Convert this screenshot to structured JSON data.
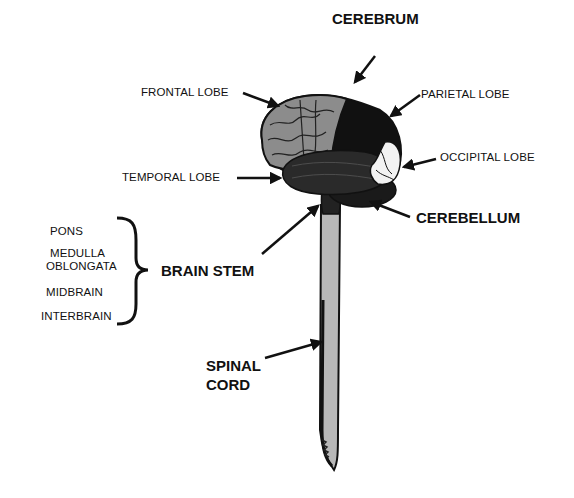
{
  "diagram": {
    "labels": {
      "cerebrum": "CEREBRUM",
      "frontal_lobe": "FRONTAL LOBE",
      "parietal_lobe": "PARIETAL LOBE",
      "occipital_lobe": "OCCIPITAL LOBE",
      "temporal_lobe": "TEMPORAL LOBE",
      "cerebellum": "CEREBELLUM",
      "brain_stem": "BRAIN STEM",
      "spinal_cord_line1": "SPINAL",
      "spinal_cord_line2": "CORD"
    },
    "brain_stem_parts": {
      "pons": "PONS",
      "medulla_line1": "MEDULLA",
      "medulla_line2": "OBLONGATA",
      "midbrain": "MIDBRAIN",
      "interbrain": "INTERBRAIN"
    },
    "colors": {
      "frontal": "#8c8c8c",
      "parietal": "#111111",
      "temporal": "#2a2a2a",
      "occipital": "#f2f2f2",
      "cerebellum": "#1a1a1a",
      "cord_fill": "#b8b8b8",
      "outline": "#111111"
    }
  }
}
